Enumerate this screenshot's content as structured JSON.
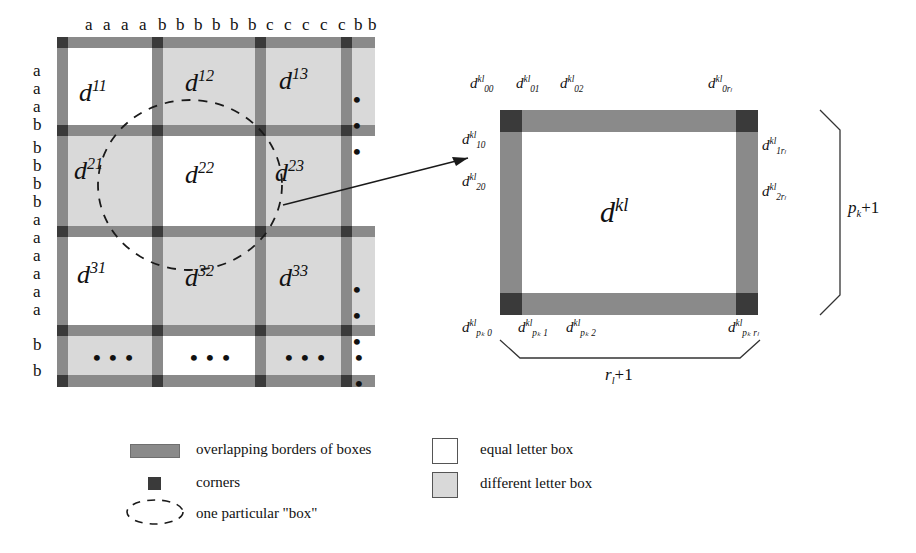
{
  "figure": {
    "grid": {
      "column_letters": [
        "a",
        "a",
        "a",
        "a",
        "b",
        "b",
        "b",
        "b",
        "b",
        "b",
        "c",
        "c",
        "c",
        "c",
        "c",
        "b",
        "b"
      ],
      "row_letters": [
        "a",
        "a",
        "a",
        "b",
        "b",
        "b",
        "b",
        "b",
        "a",
        "a",
        "a",
        "a",
        "a",
        "a",
        "b",
        "b"
      ],
      "cells": [
        [
          {
            "label": "d",
            "sup": "11",
            "fill": "white"
          },
          {
            "label": "d",
            "sup": "12",
            "fill": "gray"
          },
          {
            "label": "d",
            "sup": "13",
            "fill": "gray"
          },
          {
            "label": "…",
            "sup": "",
            "fill": "gray"
          }
        ],
        [
          {
            "label": "d",
            "sup": "21",
            "fill": "gray"
          },
          {
            "label": "d",
            "sup": "22",
            "fill": "white"
          },
          {
            "label": "d",
            "sup": "23",
            "fill": "gray"
          },
          {
            "label": "",
            "sup": "",
            "fill": "white"
          }
        ],
        [
          {
            "label": "d",
            "sup": "31",
            "fill": "white"
          },
          {
            "label": "d",
            "sup": "32",
            "fill": "gray"
          },
          {
            "label": "d",
            "sup": "33",
            "fill": "gray"
          },
          {
            "label": "…",
            "sup": "",
            "fill": "gray"
          }
        ],
        [
          {
            "label": "…",
            "sup": "",
            "fill": "gray"
          },
          {
            "label": "…",
            "sup": "",
            "fill": "white"
          },
          {
            "label": "…",
            "sup": "",
            "fill": "gray"
          },
          {
            "label": "…",
            "sup": "",
            "fill": "white"
          }
        ]
      ],
      "dots_glyph": "• • •"
    },
    "detail": {
      "center_label": "d",
      "center_sup": "kl",
      "top_labels": [
        {
          "base": "d",
          "sup": "kl",
          "sub": "00"
        },
        {
          "base": "d",
          "sup": "kl",
          "sub": "01"
        },
        {
          "base": "d",
          "sup": "kl",
          "sub": "02"
        },
        {
          "base": "d",
          "sup": "kl",
          "sub": "0rₗ"
        }
      ],
      "left_labels": [
        {
          "base": "d",
          "sup": "kl",
          "sub": "10"
        },
        {
          "base": "d",
          "sup": "kl",
          "sub": "20"
        }
      ],
      "right_labels": [
        {
          "base": "d",
          "sup": "kl",
          "sub": "1rₗ"
        },
        {
          "base": "d",
          "sup": "kl",
          "sub": "2rₗ"
        }
      ],
      "bottom_labels": [
        {
          "base": "d",
          "sup": "kl",
          "sub": "pₖ 0"
        },
        {
          "base": "d",
          "sup": "kl",
          "sub": "pₖ 1"
        },
        {
          "base": "d",
          "sup": "kl",
          "sub": "pₖ 2"
        },
        {
          "base": "d",
          "sup": "kl",
          "sub": "pₖ rₗ"
        }
      ],
      "brace_right_label": "pₖ+1",
      "brace_bottom_label": "rₗ+1"
    },
    "legend": {
      "items": [
        {
          "key": "overlapping-borders",
          "swatch": "border-bar",
          "text": "overlapping borders of boxes"
        },
        {
          "key": "corners",
          "swatch": "corner-square",
          "text": "corners"
        },
        {
          "key": "one-particular-box",
          "swatch": "dashed-ellipse",
          "text": "one particular \"box\""
        },
        {
          "key": "equal-letter-box",
          "swatch": "white-square",
          "text": "equal letter box"
        },
        {
          "key": "different-letter-box",
          "swatch": "gray-square",
          "text": "different letter box"
        }
      ]
    },
    "colors": {
      "border_gray": "#8a8a8a",
      "corner_dark": "#3a3a3a",
      "cell_gray": "#d9d9d9",
      "cell_white": "#ffffff",
      "ink": "#111111"
    }
  }
}
